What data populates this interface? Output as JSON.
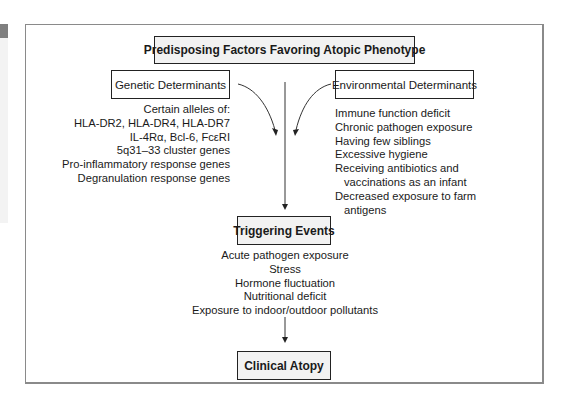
{
  "diagram": {
    "title": "Predisposing Factors Favoring Atopic  Phenotype",
    "genetic": {
      "label": "Genetic Determinants",
      "items": [
        "Certain alleles of:",
        "HLA-DR2, HLA-DR4, HLA-DR7",
        "IL-4Rα, Bcl-6, FcεRI",
        "5q31–33 cluster genes",
        "Pro-inflammatory response genes",
        "Degranulation response genes"
      ]
    },
    "environmental": {
      "label": "Environmental Determinants",
      "items": [
        "Immune function deficit",
        "Chronic pathogen exposure",
        "Having few siblings",
        "Excessive hygiene",
        "Receiving antibiotics and",
        "vaccinations as an infant",
        "Decreased exposure to farm",
        "antigens"
      ]
    },
    "triggering": {
      "label": "Triggering Events",
      "items": [
        "Acute pathogen exposure",
        "Stress",
        "Hormone fluctuation",
        "Nutritional deficit",
        "Exposure to indoor/outdoor pollutants"
      ]
    },
    "outcome": {
      "label": "Clinical Atopy"
    }
  },
  "colors": {
    "box_fill": "#f2f2f2",
    "border": "#222222",
    "frame": "#8a8a8a"
  }
}
